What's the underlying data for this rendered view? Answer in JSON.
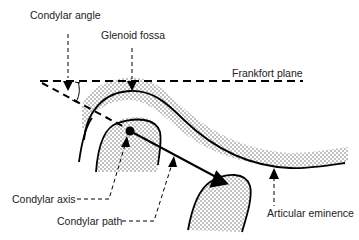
{
  "diagram": {
    "labels": {
      "condylar_angle": "Condylar angle",
      "glenoid_fossa": "Glenoid fossa",
      "frankfort_plane": "Frankfort plane",
      "condylar_axis": "Condylar axis",
      "condylar_path": "Condylar path",
      "articular_eminence": "Articular eminence"
    },
    "colors": {
      "ink": "#000000",
      "text": "#222222",
      "stipple": "#555555",
      "background": "#ffffff"
    }
  }
}
